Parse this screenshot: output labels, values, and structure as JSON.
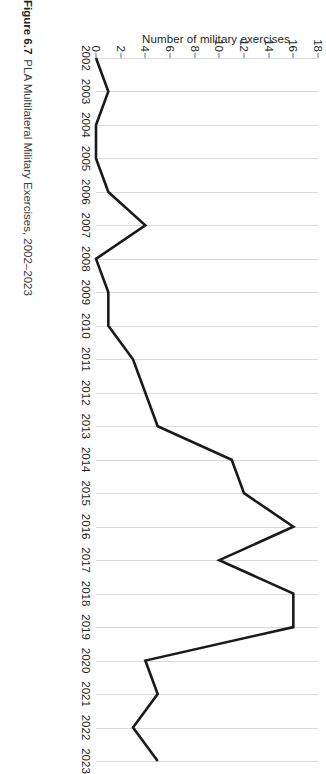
{
  "caption": {
    "label": "Figure 6.7",
    "text": "PLA Multilateral Military Exercises, 2002–2023"
  },
  "colors": {
    "line": "#1a1a1a",
    "grid": "#d9dadb",
    "text": "#231f20",
    "tick_mark": "#6d6e71",
    "background": "#ffffff"
  },
  "chart_data": {
    "type": "line",
    "title": "",
    "subtitle": "",
    "xlabel": "",
    "ylabel": "Number of military exercises",
    "categories": [
      "2002",
      "2003",
      "2004",
      "2005",
      "2006",
      "2007",
      "2008",
      "2009",
      "2010",
      "2011",
      "2012",
      "2013",
      "2014",
      "2015",
      "2016",
      "2017",
      "2018",
      "2019",
      "2020",
      "2021",
      "2022",
      "2023"
    ],
    "values": [
      0,
      1,
      0,
      0,
      1,
      4,
      0,
      1,
      1,
      3,
      4,
      5,
      11,
      12,
      16,
      10,
      16,
      16,
      4,
      5,
      3,
      5
    ],
    "series": [
      {
        "name": "Number of military exercises",
        "values": [
          0,
          1,
          0,
          0,
          1,
          4,
          0,
          1,
          1,
          3,
          4,
          5,
          11,
          12,
          16,
          10,
          16,
          16,
          4,
          5,
          3,
          5
        ]
      }
    ],
    "x": [
      2002,
      2003,
      2004,
      2005,
      2006,
      2007,
      2008,
      2009,
      2010,
      2011,
      2012,
      2013,
      2014,
      2015,
      2016,
      2017,
      2018,
      2019,
      2020,
      2021,
      2022,
      2023
    ],
    "ylim": [
      0,
      18
    ],
    "xlim": [
      2002,
      2023
    ],
    "y_ticks": [
      0,
      2,
      4,
      6,
      8,
      10,
      12,
      14,
      16,
      18
    ],
    "x_ticks": [
      "2002",
      "2003",
      "2004",
      "2005",
      "2006",
      "2007",
      "2008",
      "2009",
      "2010",
      "2011",
      "2012",
      "2013",
      "2014",
      "2015",
      "2016",
      "2017",
      "2018",
      "2019",
      "2020",
      "2021",
      "2022",
      "2023"
    ],
    "grid": "vertical",
    "legend": "none",
    "legend_position": "none",
    "annotations": []
  }
}
